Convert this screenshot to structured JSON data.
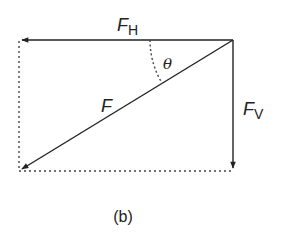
{
  "diagram": {
    "caption": "(b)",
    "labels": {
      "horizontal_force": {
        "main": "F",
        "sub": "H"
      },
      "vertical_force": {
        "main": "F",
        "sub": "V"
      },
      "resultant_force": {
        "main": "F"
      },
      "angle": "θ"
    },
    "colors": {
      "line": "#222222",
      "dotted": "#444444",
      "background": "#ffffff"
    },
    "vectors": [
      {
        "name": "F_H",
        "from": [
          233,
          40
        ],
        "to": [
          19,
          40
        ],
        "style": "solid"
      },
      {
        "name": "F_V",
        "from": [
          233,
          40
        ],
        "to": [
          233,
          171
        ],
        "style": "solid"
      },
      {
        "name": "F",
        "from": [
          233,
          40
        ],
        "to": [
          19,
          171
        ],
        "style": "solid"
      }
    ],
    "construction_lines": [
      {
        "from": [
          19,
          40
        ],
        "to": [
          19,
          171
        ],
        "style": "dotted"
      },
      {
        "from": [
          19,
          171
        ],
        "to": [
          233,
          171
        ],
        "style": "dotted"
      }
    ]
  }
}
